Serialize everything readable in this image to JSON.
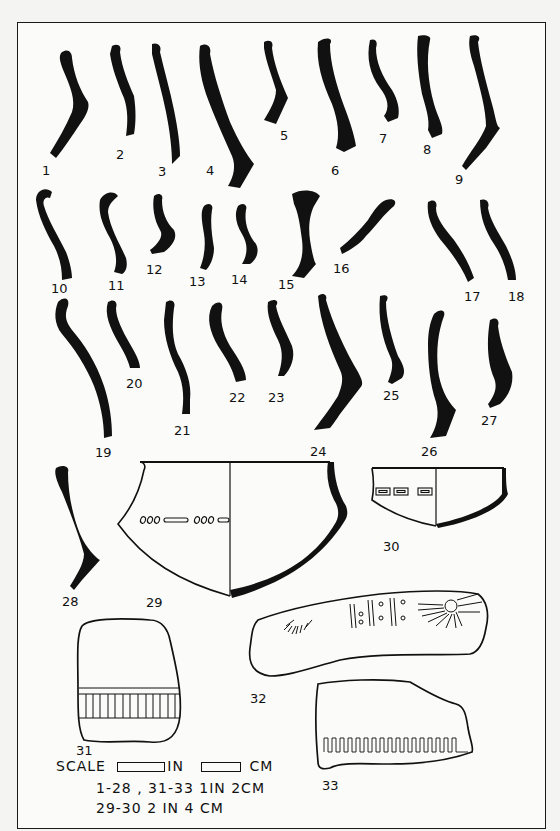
{
  "plate": {
    "title": "Pottery rim and decorated sherd profiles",
    "ink_color": "#111111",
    "paper_color": "#fbfbf9"
  },
  "figures": {
    "f1": "1",
    "f2": "2",
    "f3": "3",
    "f4": "4",
    "f5": "5",
    "f6": "6",
    "f7": "7",
    "f8": "8",
    "f9": "9",
    "f10": "10",
    "f11": "11",
    "f12": "12",
    "f13": "13",
    "f14": "14",
    "f15": "15",
    "f16": "16",
    "f17": "17",
    "f18": "18",
    "f19": "19",
    "f20": "20",
    "f21": "21",
    "f22": "22",
    "f23": "23",
    "f24": "24",
    "f25": "25",
    "f26": "26",
    "f27": "27",
    "f28": "28",
    "f29": "29",
    "f30": "30",
    "f31": "31",
    "f32": "32",
    "f33": "33"
  },
  "scale": {
    "label": "SCALE",
    "unit_in": "IN",
    "unit_cm": "CM",
    "line1": "1-28 , 31-33  1IN  2CM",
    "line2": "29-30  2 IN  4 CM"
  }
}
